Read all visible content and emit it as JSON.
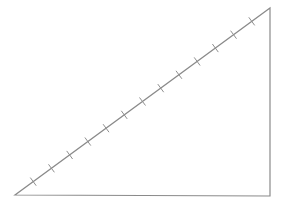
{
  "diagram": {
    "type": "right-triangle",
    "stroke_color": "#8a8a8a",
    "tick_color": "#8f8f8f",
    "vertices": {
      "bottom_left": [
        15,
        195
      ],
      "bottom_right": [
        270,
        196
      ],
      "top_right": [
        270,
        8
      ]
    },
    "hypotenuse_ticks": {
      "count": 13,
      "tick_half_length": 5
    }
  }
}
